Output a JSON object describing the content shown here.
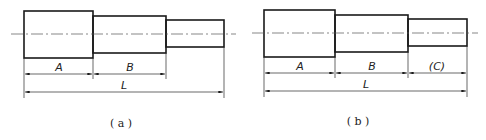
{
  "figure": {
    "colors": {
      "line": "#1a1a1a",
      "centerline": "#555555",
      "background": "#ffffff"
    },
    "panels": [
      {
        "id": "a",
        "caption": "( a )",
        "dimensions": {
          "A": "A",
          "B": "B",
          "L": "L"
        }
      },
      {
        "id": "b",
        "caption": "( b )",
        "dimensions": {
          "A": "A",
          "B": "B",
          "C": "(C)",
          "L": "L"
        }
      }
    ]
  }
}
